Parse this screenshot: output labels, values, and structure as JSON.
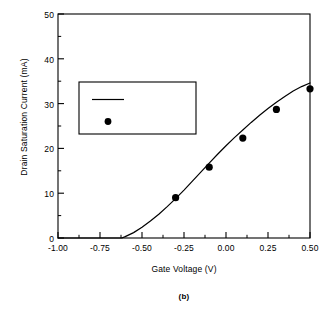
{
  "chart_data": {
    "type": "line",
    "title": "",
    "caption": "(b)",
    "xlabel": "Gate Voltage (V)",
    "ylabel": "Drain Saturation Current (mA)",
    "xlim": [
      -1.0,
      0.5
    ],
    "ylim": [
      0,
      50
    ],
    "grid": false,
    "legend_position": "upper-left-inside",
    "xticks": [
      -1.0,
      -0.75,
      -0.5,
      -0.25,
      0.0,
      0.25,
      0.5
    ],
    "xtick_labels": [
      "-1.00",
      "-0.75",
      "-0.50",
      "-0.25",
      "0.00",
      "0.25",
      "0.50"
    ],
    "xminor_ticks": [
      -0.875,
      -0.625,
      -0.375,
      -0.125,
      0.125,
      0.375
    ],
    "yticks": [
      0,
      10,
      20,
      30,
      40,
      50
    ],
    "ytick_labels": [
      "0",
      "10",
      "20",
      "30",
      "40",
      "50"
    ],
    "yminor_ticks": [
      5,
      15,
      25,
      35,
      45
    ],
    "series": [
      {
        "name": "Calculated",
        "type": "line",
        "marker": "none",
        "color": "#000000",
        "x": [
          -1.0,
          -0.9,
          -0.8,
          -0.7,
          -0.65,
          -0.62,
          -0.6,
          -0.55,
          -0.5,
          -0.45,
          -0.4,
          -0.35,
          -0.3,
          -0.25,
          -0.2,
          -0.15,
          -0.1,
          -0.05,
          0.0,
          0.05,
          0.1,
          0.15,
          0.2,
          0.25,
          0.3,
          0.35,
          0.4,
          0.45,
          0.5
        ],
        "y": [
          0.0,
          0.0,
          0.0,
          0.0,
          0.0,
          0.0,
          0.3,
          1.2,
          2.4,
          3.8,
          5.3,
          7.0,
          8.8,
          10.7,
          12.7,
          14.7,
          16.7,
          18.7,
          20.6,
          22.4,
          24.1,
          25.8,
          27.4,
          28.9,
          30.3,
          31.6,
          32.8,
          33.8,
          34.6
        ]
      },
      {
        "name": "Measured",
        "type": "scatter",
        "marker": "filled-circle",
        "color": "#000000",
        "x": [
          -0.3,
          -0.1,
          0.1,
          0.3,
          0.5
        ],
        "y": [
          9.0,
          15.8,
          22.3,
          28.7,
          33.3
        ]
      }
    ],
    "legend": [
      {
        "label": "Calculated",
        "marker": "line"
      },
      {
        "label": "Measured",
        "marker": "filled-circle"
      }
    ]
  }
}
